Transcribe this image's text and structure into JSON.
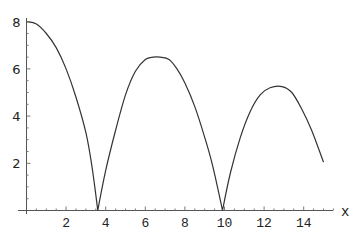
{
  "chart_data": {
    "type": "line",
    "title": "",
    "xlabel": "x",
    "ylabel": "",
    "xlim": [
      0,
      15.5
    ],
    "ylim": [
      0,
      8
    ],
    "grid": false,
    "legend": null,
    "x_ticks": [
      2,
      4,
      6,
      8,
      10,
      12,
      14
    ],
    "y_ticks": [
      2,
      4,
      6,
      8
    ],
    "series": [
      {
        "name": "f(x)",
        "color": "#333333",
        "x": [
          0,
          0.5,
          1,
          1.5,
          2,
          2.5,
          3,
          3.3,
          3.6,
          4,
          4.5,
          5,
          5.5,
          6,
          6.4,
          6.75,
          7.2,
          7.6,
          8,
          8.5,
          9,
          9.4,
          9.9,
          10.3,
          10.8,
          11.3,
          11.8,
          12.3,
          12.9,
          13.4,
          13.9,
          14.4,
          15
        ],
        "y": [
          8.0,
          7.9,
          7.5,
          6.9,
          6.0,
          4.8,
          3.3,
          1.9,
          0.0,
          1.7,
          3.4,
          4.9,
          5.9,
          6.4,
          6.5,
          6.5,
          6.4,
          6.0,
          5.4,
          4.4,
          3.1,
          1.9,
          0.0,
          1.6,
          3.1,
          4.2,
          4.9,
          5.2,
          5.25,
          5.0,
          4.3,
          3.4,
          2.05
        ]
      }
    ]
  },
  "axes": {
    "x_axis_label": "x",
    "x_tick_labels": [
      "2",
      "4",
      "6",
      "8",
      "10",
      "12",
      "14"
    ],
    "y_tick_labels": [
      "2",
      "4",
      "6",
      "8"
    ]
  }
}
